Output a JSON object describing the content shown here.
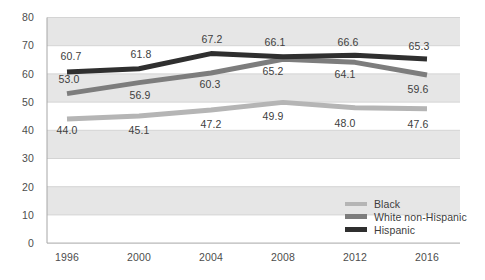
{
  "chart_data": {
    "type": "line",
    "title": "",
    "xlabel": "",
    "ylabel": "",
    "categories": [
      "1996",
      "2000",
      "2004",
      "2008",
      "2012",
      "2016"
    ],
    "ylim": [
      0,
      80
    ],
    "y_ticks": [
      "0",
      "10",
      "20",
      "30",
      "40",
      "50",
      "60",
      "70",
      "80"
    ],
    "grid": true,
    "banded_background": true,
    "legend_position": "bottom-right",
    "series": [
      {
        "name": "Black",
        "color": "#b5b5b5",
        "values": [
          44.0,
          45.1,
          47.2,
          49.9,
          48.0,
          47.6
        ],
        "labels": [
          "44.0",
          "45.1",
          "47.2",
          "49.9",
          "48.0",
          "47.6"
        ]
      },
      {
        "name": "White non-Hispanic",
        "color": "#7d7d7d",
        "values": [
          53.0,
          56.9,
          60.3,
          65.2,
          64.1,
          59.6
        ],
        "labels": [
          "53.0",
          "56.9",
          "60.3",
          "65.2",
          "64.1",
          "59.6"
        ]
      },
      {
        "name": "Hispanic",
        "color": "#2f2f2f",
        "values": [
          60.7,
          61.8,
          67.2,
          66.1,
          66.6,
          65.3
        ],
        "labels": [
          "60.7",
          "61.8",
          "67.2",
          "66.1",
          "66.6",
          "65.3"
        ]
      }
    ]
  },
  "axis": {
    "y_ticks": [
      "80",
      "70",
      "60",
      "50",
      "40",
      "30",
      "20",
      "10",
      "0"
    ],
    "x_ticks": [
      "1996",
      "2000",
      "2004",
      "2008",
      "2012",
      "2016"
    ]
  },
  "legend": {
    "items": [
      {
        "label": "Black",
        "color": "#b5b5b5"
      },
      {
        "label": "White non-Hispanic",
        "color": "#7d7d7d"
      },
      {
        "label": "Hispanic",
        "color": "#2f2f2f"
      }
    ]
  },
  "data_labels": {
    "black": [
      "44.0",
      "45.1",
      "47.2",
      "49.9",
      "48.0",
      "47.6"
    ],
    "white": [
      "53.0",
      "56.9",
      "60.3",
      "65.2",
      "64.1",
      "59.6"
    ],
    "hispanic": [
      "60.7",
      "61.8",
      "67.2",
      "66.1",
      "66.6",
      "65.3"
    ]
  }
}
